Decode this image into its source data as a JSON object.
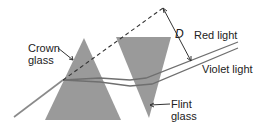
{
  "diagram": {
    "labels": {
      "crown_glass_line1": "Crown",
      "crown_glass_line2": "glass",
      "flint_glass_line1": "Flint",
      "flint_glass_line2": "glass",
      "red_light": "Red light",
      "violet_light": "Violet light",
      "deviation": "D"
    },
    "colors": {
      "prism_fill": "#9a9a9a",
      "ray": "#8a8a8a",
      "dashed": "#333333",
      "text": "#222222",
      "background": "#ffffff"
    },
    "elements": [
      {
        "id": "crown-prism",
        "shape": "triangle",
        "points": [
          [
            84,
            38
          ],
          [
            45,
            120
          ],
          [
            121,
            120
          ]
        ]
      },
      {
        "id": "flint-prism",
        "shape": "inverted-triangle",
        "points": [
          [
            116,
            37
          ],
          [
            171,
            37
          ],
          [
            149,
            118
          ]
        ]
      },
      {
        "id": "incident-ray",
        "from": [
          14,
          117
        ],
        "to": [
          63,
          80
        ]
      },
      {
        "id": "undeviated-dashed-line",
        "from": [
          63,
          80
        ],
        "to": [
          163,
          8
        ]
      },
      {
        "id": "red-ray",
        "to": [
          238,
          42
        ]
      },
      {
        "id": "violet-ray",
        "to": [
          238,
          48
        ]
      },
      {
        "id": "deviation-D-marker",
        "from": [
          163,
          8
        ],
        "to": [
          191,
          61
        ]
      }
    ]
  }
}
